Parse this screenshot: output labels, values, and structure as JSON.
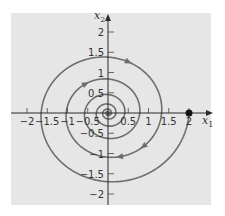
{
  "chart_data": {
    "type": "line",
    "title": "",
    "xlabel": "x1",
    "ylabel": "x2",
    "xlim": [
      -2.0,
      2.2
    ],
    "ylim": [
      -2.2,
      2.4
    ],
    "grid": false,
    "legend": null,
    "x_ticks": [
      -2,
      -1.5,
      -1,
      -0.5,
      0.5,
      1,
      1.5,
      2
    ],
    "x_tick_labels": [
      "−2",
      "−1.5",
      "−1",
      "−0.5",
      "0.5",
      "1",
      "1.5",
      "2"
    ],
    "y_ticks": [
      2,
      1.5,
      1,
      0.5,
      -0.5,
      -1,
      -1.5,
      -2
    ],
    "y_tick_labels": [
      "2",
      "1.5",
      "1",
      "0.5",
      "−0.5",
      "−1",
      "−1.5",
      "−2"
    ],
    "series": [
      {
        "name": "trajectory",
        "kind": "clockwise spiral into origin",
        "start_point": [
          2,
          0
        ],
        "sample_points": [
          [
            2,
            0
          ],
          [
            0,
            -1.8
          ],
          [
            -1.55,
            0
          ],
          [
            0,
            1.5
          ],
          [
            1.4,
            0
          ],
          [
            0,
            -1.25
          ],
          [
            -1.05,
            0
          ],
          [
            0,
            1.0
          ],
          [
            0.95,
            0
          ],
          [
            0,
            -0.8
          ],
          [
            0,
            0
          ]
        ],
        "color": "#6e6e6e"
      }
    ],
    "equilibrium": [
      0,
      0
    ],
    "marked_point": {
      "x": 2,
      "y": 0,
      "color": "#111111"
    },
    "arrows_direction": "clockwise"
  },
  "plot": {
    "background": "#e6e6e6",
    "axis_color": "#2a2a2a",
    "curve_color": "#6e6e6e",
    "origin_px": [
      108,
      113
    ],
    "px_per_unit": 40.5,
    "box": [
      11,
      13,
      211,
      205
    ]
  },
  "labels": {
    "x_axis": "x",
    "x_axis_sub": "1",
    "y_axis": "x",
    "y_axis_sub": "2"
  }
}
